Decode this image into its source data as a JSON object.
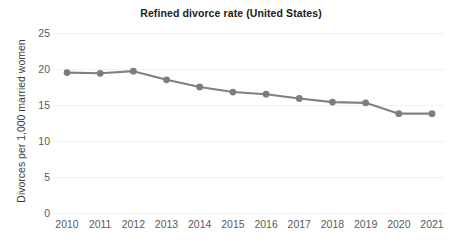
{
  "chart_data": {
    "type": "line",
    "title": "Refined divorce rate (United States)",
    "xlabel": "",
    "ylabel": "Divorces per 1,000 married women",
    "categories": [
      "2010",
      "2011",
      "2012",
      "2013",
      "2014",
      "2015",
      "2016",
      "2017",
      "2018",
      "2019",
      "2020",
      "2021"
    ],
    "x": [
      2010,
      2011,
      2012,
      2013,
      2014,
      2015,
      2016,
      2017,
      2018,
      2019,
      2020,
      2021
    ],
    "values": [
      19.5,
      19.4,
      19.7,
      18.5,
      17.5,
      16.8,
      16.5,
      15.9,
      15.4,
      15.3,
      13.8,
      13.8
    ],
    "series": [
      {
        "name": "Refined divorce rate",
        "values": [
          19.5,
          19.4,
          19.7,
          18.5,
          17.5,
          16.8,
          16.5,
          15.9,
          15.4,
          15.3,
          13.8,
          13.8
        ]
      }
    ],
    "ylim": [
      0,
      25
    ],
    "yticks": [
      0,
      5,
      10,
      15,
      20,
      25
    ],
    "ytick_labels": [
      "0",
      "5",
      "10",
      "15",
      "20",
      "25"
    ],
    "xtick_labels": [
      "2010",
      "2011",
      "2012",
      "2013",
      "2014",
      "2015",
      "2016",
      "2017",
      "2018",
      "2019",
      "2020",
      "2021"
    ],
    "grid": "horizontal",
    "legend": "none",
    "colors": {
      "line": "#808080",
      "marker": "#7d7d7d",
      "gridline": "#f0f0f2",
      "background": "#ffffff",
      "title_text": "#1c1c1c",
      "tick_text": "#5a5a5a",
      "axis_label_text": "#3d3d3d"
    },
    "annotations": []
  }
}
